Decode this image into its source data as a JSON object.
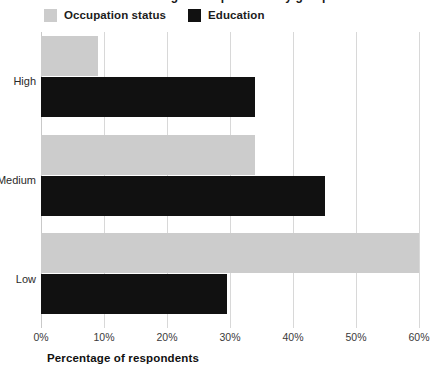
{
  "chart_data": {
    "type": "bar",
    "orientation": "horizontal",
    "title": "",
    "xlabel": "Percentage of respondents",
    "ylabel": "",
    "categories": [
      "High",
      "Medium",
      "Low"
    ],
    "series": [
      {
        "name": "Occupation status",
        "color": "#cccccc",
        "values": [
          9,
          34,
          60
        ]
      },
      {
        "name": "Education",
        "color": "#111111",
        "values": [
          34,
          45,
          29.5
        ]
      }
    ],
    "xlim": [
      0,
      60
    ],
    "xticks": [
      0,
      10,
      20,
      30,
      40,
      50,
      60
    ],
    "xtick_labels": [
      "0%",
      "10%",
      "20%",
      "30%",
      "40%",
      "50%",
      "60%"
    ],
    "grid": true,
    "legend_position": "top-left"
  },
  "legend": {
    "items": [
      {
        "label": "Occupation status",
        "swatch": "legend-swatch-occupation-status"
      },
      {
        "label": "Education",
        "swatch": "legend-swatch-education"
      }
    ]
  },
  "axis": {
    "x_title": "Percentage of respondents"
  },
  "title_sliver": {
    "text": "Percentage of respondents by group"
  }
}
